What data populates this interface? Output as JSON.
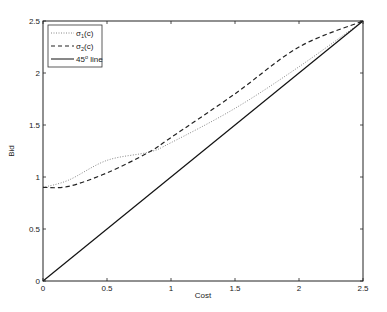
{
  "chart_data": {
    "type": "line",
    "title": "",
    "xlabel": "Cost",
    "ylabel": "Bid",
    "xlim": [
      0,
      2.5
    ],
    "ylim": [
      0,
      2.5
    ],
    "xticks": [
      0,
      0.5,
      1,
      1.5,
      2,
      2.5
    ],
    "yticks": [
      0,
      0.5,
      1,
      1.5,
      2,
      2.5
    ],
    "xtick_labels": [
      "0",
      "0.5",
      "1",
      "1.5",
      "2",
      "2.5"
    ],
    "ytick_labels": [
      "0",
      "0.5",
      "1",
      "1.5",
      "2",
      "2.5"
    ],
    "grid": false,
    "legend_position": "upper-left",
    "series": [
      {
        "name": "σ1(c)",
        "style": "dotted",
        "color": "#888888",
        "x": [
          0,
          0.2,
          0.5,
          0.83,
          1.0,
          1.5,
          2.0,
          2.5
        ],
        "values": [
          0.9,
          0.97,
          1.16,
          1.24,
          1.33,
          1.66,
          2.06,
          2.5
        ]
      },
      {
        "name": "σ2(c)",
        "style": "dashed",
        "color": "#222222",
        "x": [
          0,
          0.2,
          0.5,
          0.83,
          1.0,
          1.5,
          2.0,
          2.5
        ],
        "values": [
          0.9,
          0.91,
          1.04,
          1.24,
          1.38,
          1.8,
          2.25,
          2.5
        ]
      },
      {
        "name": "45° line",
        "style": "solid",
        "color": "#111111",
        "x": [
          0,
          2.5
        ],
        "values": [
          0,
          2.5
        ]
      }
    ]
  },
  "legend": {
    "items": [
      {
        "label": "σ",
        "sub": "1",
        "suffix": "(c)"
      },
      {
        "label": "σ",
        "sub": "2",
        "suffix": "(c)"
      },
      {
        "label": "45",
        "sup": "o",
        "suffix": " line"
      }
    ]
  },
  "axes": {
    "xlabel": "Cost",
    "ylabel": "Bid"
  }
}
